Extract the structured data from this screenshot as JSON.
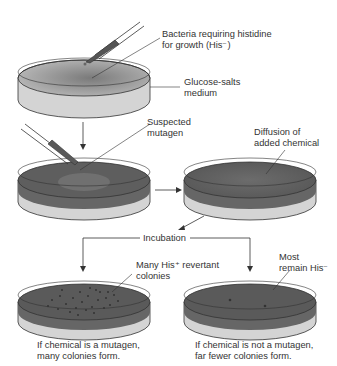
{
  "diagram": {
    "labels": {
      "bacteria": [
        "Bacteria requiring histidine",
        "for growth (His⁻)"
      ],
      "medium": [
        "Glucose-salts",
        "medium"
      ],
      "mutagen": [
        "Suspected",
        "mutagen"
      ],
      "diffusion": [
        "Diffusion of",
        "added chemical"
      ],
      "incubation": "Incubation",
      "revertants": [
        "Many His⁺ revertant",
        "colonies"
      ],
      "remain": [
        "Most",
        "remain His⁻"
      ],
      "result_mutagen": [
        "If chemical is a mutagen,",
        "many colonies form."
      ],
      "result_not_mutagen": [
        "If chemical is not a mutagen,",
        "far fewer colonies form."
      ]
    },
    "colors": {
      "medium_light": "#a8a8a8",
      "medium_dark": "#5e5e5e",
      "dish_side": "#d4d4d4",
      "outline": "#333333",
      "colony": "#3a3a3a"
    },
    "colony_counts": {
      "mutagen_plate": 26,
      "non_mutagen_plate": 2
    }
  }
}
